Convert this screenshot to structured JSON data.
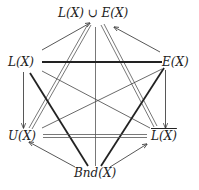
{
  "diagram": {
    "type": "lattice-hexagon",
    "nodes": {
      "top": {
        "label": "L(X) ∪ E(X)"
      },
      "left_upper": {
        "label": "L(X)"
      },
      "right_upper": {
        "label": "E(X)"
      },
      "left_lower": {
        "label": "U(X)"
      },
      "right_lower": {
        "label": "L(X)",
        "overline": true
      },
      "bottom": {
        "label": "Bnd(X)"
      }
    },
    "edges": [
      {
        "from": "left_upper",
        "to": "top",
        "style": "thin-arrow"
      },
      {
        "from": "right_upper",
        "to": "top",
        "style": "thin-arrow"
      },
      {
        "from": "top",
        "to": "left_lower",
        "style": "double"
      },
      {
        "from": "top",
        "to": "right_lower",
        "style": "double"
      },
      {
        "from": "top",
        "to": "bottom",
        "style": "thin"
      },
      {
        "from": "left_upper",
        "to": "right_upper",
        "style": "thick"
      },
      {
        "from": "left_upper",
        "to": "right_lower",
        "style": "thin"
      },
      {
        "from": "right_upper",
        "to": "left_lower",
        "style": "thin"
      },
      {
        "from": "left_upper",
        "to": "bottom",
        "style": "thick"
      },
      {
        "from": "right_upper",
        "to": "bottom",
        "style": "thick"
      },
      {
        "from": "left_upper",
        "to": "left_lower",
        "style": "thin-arrow"
      },
      {
        "from": "right_upper",
        "to": "right_lower",
        "style": "thin-arrow"
      },
      {
        "from": "left_lower",
        "to": "right_lower",
        "style": "double"
      },
      {
        "from": "bottom",
        "to": "left_lower",
        "style": "thin-arrow"
      },
      {
        "from": "bottom",
        "to": "right_lower",
        "style": "thin-arrow"
      }
    ]
  }
}
